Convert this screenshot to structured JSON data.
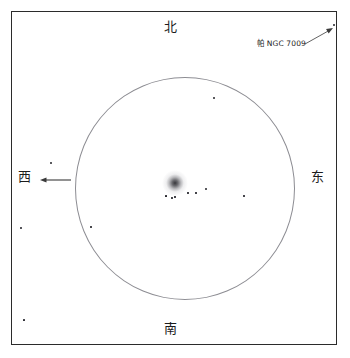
{
  "chart": {
    "type": "star-chart",
    "background_color": "#ffffff",
    "frame": {
      "x": 11,
      "y": 11,
      "width": 326,
      "height": 334,
      "border_color": "#2b2b2b"
    },
    "field_of_view_circle": {
      "center_x": 173,
      "center_y": 176,
      "radius_x": 110,
      "radius_y": 111.5,
      "stroke_color": "#8d8d93"
    }
  },
  "cardinals": {
    "north": "北",
    "south": "南",
    "west": "西",
    "east": "东"
  },
  "annotations": {
    "object_label": "帕 NGC 7009"
  },
  "chart_data": {
    "type": "scatter",
    "xlabel": "",
    "ylabel": "",
    "xlim": [
      11,
      337
    ],
    "ylim": [
      11,
      345
    ],
    "grid": false,
    "legend": null,
    "deep_sky_objects": [
      {
        "name": "NGC 7009",
        "x": 175,
        "y": 183,
        "size": 26,
        "kind": "nebula"
      }
    ],
    "stars": [
      {
        "x": 214,
        "y": 98,
        "size": 2.2
      },
      {
        "x": 206,
        "y": 189,
        "size": 2.2
      },
      {
        "x": 172,
        "y": 198,
        "size": 1.6
      },
      {
        "x": 196,
        "y": 193,
        "size": 1.4
      },
      {
        "x": 51,
        "y": 163,
        "size": 2.4
      },
      {
        "x": 188,
        "y": 193,
        "size": 1.3
      },
      {
        "x": 21,
        "y": 228,
        "size": 1.8
      },
      {
        "x": 91,
        "y": 227,
        "size": 1.6
      },
      {
        "x": 334,
        "y": 25,
        "size": 2.0
      },
      {
        "x": 175,
        "y": 197,
        "size": 1.3
      },
      {
        "x": 24,
        "y": 320,
        "size": 1.7
      },
      {
        "x": 244,
        "y": 196,
        "size": 1.5
      },
      {
        "x": 166,
        "y": 196,
        "size": 1.2
      }
    ],
    "direction_arrow": {
      "from_x": 71,
      "from_y": 180,
      "to_x": 40,
      "to_y": 180,
      "points_to": "西",
      "color": "#3a3a3a"
    },
    "leader_line": {
      "from_x": 305,
      "from_y": 44,
      "to_x": 333,
      "to_y": 28,
      "label": "帕 NGC 7009",
      "color": "#3a3a3a"
    }
  }
}
